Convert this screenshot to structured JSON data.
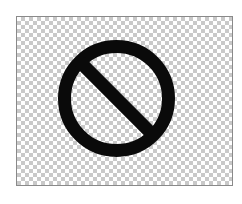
{
  "image": {
    "description": "Prohibited / no symbol on a transparent checkerboard background",
    "icon": "prohibited-icon",
    "colors": {
      "symbol": "#0a0a0a",
      "checker_light": "#ffffff",
      "checker_dark": "#c9c9c9",
      "frame_border": "#8a8a8a",
      "page_background": "#ffffff"
    }
  }
}
